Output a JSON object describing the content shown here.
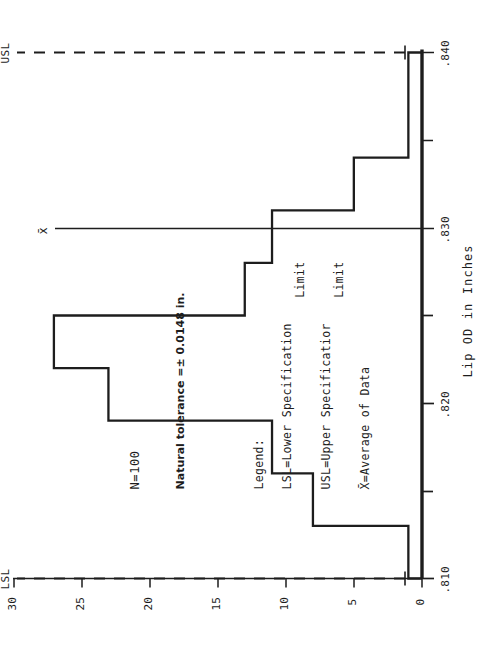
{
  "figure": {
    "orientation": "rotated-90-ccw",
    "ink_color": "#1d1d1d",
    "background": "#ffffff"
  },
  "annotations": {
    "sample_size": "N=100",
    "natural_tolerance": "Natural tolerance =± 0.0148 in.",
    "lsl_marker": "LSL",
    "usl_marker": "USL",
    "xbar_marker": "x̄"
  },
  "legend": {
    "title": "Legend:",
    "entries": [
      {
        "line1": "LSL=Lower Specification",
        "line2": "Limit"
      },
      {
        "line1": "USL=Upper Specificatior",
        "line2": "Limit"
      },
      {
        "line1": "X̄=Average of Data",
        "line2": ""
      }
    ]
  },
  "axes": {
    "x": {
      "label": "Lip OD in Inches",
      "ticks": [
        ".810",
        ".820",
        ".830",
        ".840"
      ],
      "minor_ticks": 3,
      "range": [
        0.81,
        0.84
      ]
    },
    "y": {
      "label": "",
      "ticks": [
        "0",
        "5",
        "10",
        "15",
        "20",
        "25",
        "30"
      ],
      "range": [
        0,
        30
      ]
    }
  },
  "chart_data": {
    "type": "bar",
    "title": "",
    "subtitle": "",
    "xlabel": "Lip OD in Inches",
    "ylabel": "Frequency",
    "xlim": [
      0.81,
      0.84
    ],
    "ylim": [
      0,
      30
    ],
    "grid": false,
    "legend_position": "top-right",
    "orientation": "horizontal-rotated",
    "bin_width": 0.003,
    "bin_edges": [
      0.81,
      0.813,
      0.816,
      0.819,
      0.822,
      0.825,
      0.828,
      0.831,
      0.834,
      0.837,
      0.84
    ],
    "categories": [
      ".810-.813",
      ".813-.816",
      ".816-.819",
      ".819-.822",
      ".822-.825",
      ".825-.828",
      ".828-.831",
      ".831-.834",
      ".834-.837",
      ".837-.840"
    ],
    "values": [
      1,
      8,
      11,
      23,
      27,
      13,
      11,
      5,
      1,
      1
    ],
    "annotations": [
      {
        "name": "LSL",
        "value": 0.81,
        "style": "dashed"
      },
      {
        "name": "USL",
        "value": 0.84,
        "style": "dashed"
      },
      {
        "name": "xbar",
        "value": 0.825,
        "style": "solid"
      }
    ],
    "notes": [
      "N=100",
      "Natural tolerance =± 0.0148 in."
    ]
  }
}
